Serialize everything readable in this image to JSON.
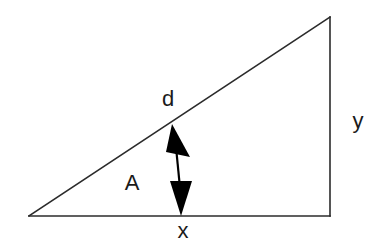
{
  "figure": {
    "background_color": "#ffffff",
    "stroke_color": "#2b2b2b",
    "fill_color": "#000000",
    "label_color": "#1a1a1a",
    "width": 380,
    "height": 248
  },
  "labels": {
    "hypotenuse": "d",
    "angle": "A",
    "vertical_side": "y",
    "horizontal_side": "x"
  },
  "geometry": {
    "vertices": {
      "left": [
        29,
        216
      ],
      "bottom_right": [
        330,
        216
      ],
      "top_right": [
        330,
        17
      ]
    },
    "sides": [
      {
        "name": "base",
        "label": "x",
        "from": [
          29,
          216
        ],
        "to": [
          330,
          216
        ]
      },
      {
        "name": "vertical",
        "label": "y",
        "from": [
          330,
          216
        ],
        "to": [
          330,
          17
        ]
      },
      {
        "name": "hypotenuse",
        "label": "d",
        "from": [
          29,
          216
        ],
        "to": [
          330,
          17
        ]
      }
    ],
    "double_arrow": {
      "name": "perpendicular-drop",
      "from": [
        172,
        124
      ],
      "to": [
        181,
        216
      ]
    },
    "angle_marker": {
      "name": "angle-A",
      "at_vertex": "left",
      "label": "A"
    }
  },
  "label_positions": {
    "hypotenuse": [
      168,
      106
    ],
    "angle": [
      132,
      190
    ],
    "vertical_side": [
      358,
      128
    ],
    "horizontal_side": [
      183,
      238
    ]
  }
}
